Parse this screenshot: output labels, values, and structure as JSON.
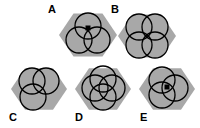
{
  "figure": {
    "type": "multiple-choice-shape-puzzle",
    "width": 200,
    "height": 128,
    "background_color": "#ffffff",
    "hexagon_fill": "#a8a8a8",
    "circle_stroke": "#000000",
    "dot_color": "#000000",
    "label_color": "#000000"
  },
  "options": [
    {
      "id": "A",
      "label": "A",
      "label_x": 48,
      "label_y": 3,
      "hex_cx": 88,
      "hex_cy": 35,
      "hex_radius": 29,
      "circle_count": 3,
      "has_center_dot": true,
      "dot_x": 88,
      "dot_y": 28,
      "circle_radius": 13,
      "circles": [
        {
          "cx": 88,
          "cy": 26
        },
        {
          "cx": 79,
          "cy": 40
        },
        {
          "cx": 97,
          "cy": 40
        }
      ]
    },
    {
      "id": "B",
      "label": "B",
      "label_x": 111,
      "label_y": 3,
      "hex_cx": 147,
      "hex_cy": 36,
      "hex_radius": 29,
      "circle_count": 4,
      "has_center_dot": false,
      "dot_x": 0,
      "dot_y": 0,
      "circle_radius": 13,
      "circles": [
        {
          "cx": 139,
          "cy": 27
        },
        {
          "cx": 155,
          "cy": 27
        },
        {
          "cx": 139,
          "cy": 45
        },
        {
          "cx": 155,
          "cy": 45
        }
      ]
    },
    {
      "id": "C",
      "label": "C",
      "label_x": 9,
      "label_y": 111,
      "hex_cx": 39,
      "hex_cy": 89,
      "hex_radius": 28,
      "circle_count": 3,
      "has_center_dot": false,
      "dot_x": 0,
      "dot_y": 0,
      "circle_radius": 13,
      "circles": [
        {
          "cx": 32,
          "cy": 81
        },
        {
          "cx": 46,
          "cy": 81
        },
        {
          "cx": 33,
          "cy": 97
        }
      ]
    },
    {
      "id": "D",
      "label": "D",
      "label_x": 75,
      "label_y": 111,
      "hex_cx": 103,
      "hex_cy": 89,
      "hex_radius": 28,
      "circle_count": 4,
      "has_center_dot": false,
      "dot_x": 0,
      "dot_y": 0,
      "circle_radius": 13,
      "circles": [
        {
          "cx": 103,
          "cy": 79
        },
        {
          "cx": 112,
          "cy": 88
        },
        {
          "cx": 95,
          "cy": 88
        },
        {
          "cx": 103,
          "cy": 97
        }
      ]
    },
    {
      "id": "E",
      "label": "E",
      "label_x": 140,
      "label_y": 111,
      "hex_cx": 167,
      "hex_cy": 89,
      "hex_radius": 28,
      "circle_count": 3,
      "has_center_dot": true,
      "dot_x": 167,
      "dot_y": 87,
      "circle_radius": 13,
      "circles": [
        {
          "cx": 162,
          "cy": 80
        },
        {
          "cx": 175,
          "cy": 88
        },
        {
          "cx": 162,
          "cy": 95
        }
      ]
    }
  ]
}
